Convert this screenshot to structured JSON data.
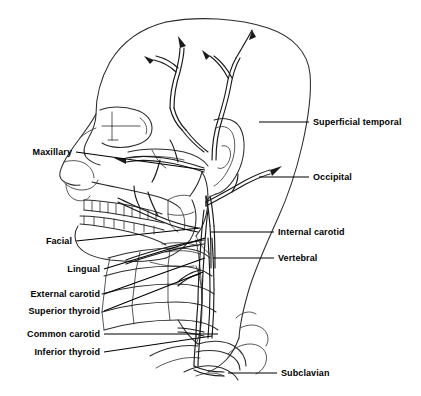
{
  "figure": {
    "background_color": "#ffffff",
    "line_color": "#2b2b2b",
    "label_color": "#000000",
    "width": 421,
    "height": 396
  },
  "labels": {
    "left": [
      {
        "id": "maxillary",
        "text": "Maxillary",
        "text_x": 72,
        "text_y": 152,
        "line": [
          [
            76,
            152
          ],
          [
            205,
            170
          ]
        ]
      },
      {
        "id": "facial",
        "text": "Facial",
        "text_x": 72,
        "text_y": 241,
        "line": [
          [
            76,
            241
          ],
          [
            200,
            228
          ]
        ]
      },
      {
        "id": "lingual",
        "text": "Lingual",
        "text_x": 100,
        "text_y": 269,
        "line": [
          [
            104,
            269
          ],
          [
            205,
            238
          ]
        ]
      },
      {
        "id": "external-carotid",
        "text": "External carotid",
        "text_x": 100,
        "text_y": 294,
        "line": [
          [
            104,
            294
          ],
          [
            205,
            258
          ]
        ]
      },
      {
        "id": "superior-thyroid",
        "text": "Superior thyroid",
        "text_x": 100,
        "text_y": 311,
        "line": [
          [
            104,
            311
          ],
          [
            203,
            272
          ]
        ]
      },
      {
        "id": "common-carotid",
        "text": "Common carotid",
        "text_x": 100,
        "text_y": 334,
        "line": [
          [
            104,
            334
          ],
          [
            218,
            334
          ]
        ]
      },
      {
        "id": "inferior-thyroid",
        "text": "Inferior thyroid",
        "text_x": 100,
        "text_y": 352,
        "line": [
          [
            104,
            352
          ],
          [
            212,
            336
          ]
        ]
      }
    ],
    "right": [
      {
        "id": "superficial-temporal",
        "text": "Superficial temporal",
        "text_x": 313,
        "text_y": 122,
        "line": [
          [
            259,
            122
          ],
          [
            309,
            122
          ]
        ]
      },
      {
        "id": "occipital",
        "text": "Occipital",
        "text_x": 313,
        "text_y": 177,
        "line": [
          [
            259,
            177
          ],
          [
            309,
            177
          ]
        ]
      },
      {
        "id": "internal-carotid",
        "text": "Internal carotid",
        "text_x": 278,
        "text_y": 232,
        "line": [
          [
            211,
            232
          ],
          [
            274,
            232
          ]
        ]
      },
      {
        "id": "vertebral",
        "text": "Vertebral",
        "text_x": 278,
        "text_y": 258,
        "line": [
          [
            213,
            258
          ],
          [
            274,
            258
          ]
        ]
      },
      {
        "id": "subclavian",
        "text": "Subclavian",
        "text_x": 281,
        "text_y": 373,
        "line": [
          [
            228,
            373
          ],
          [
            277,
            373
          ]
        ]
      }
    ]
  }
}
